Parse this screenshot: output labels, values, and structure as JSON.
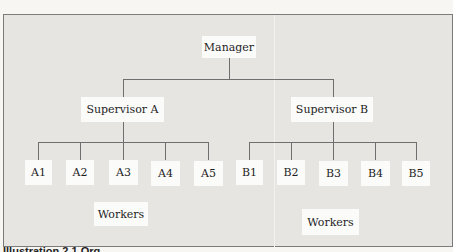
{
  "diagram": {
    "type": "org-chart",
    "root": {
      "label": "Manager"
    },
    "supervisors": [
      {
        "label": "Supervisor A",
        "workers": [
          "A1",
          "A2",
          "A3",
          "A4",
          "A5"
        ],
        "group_label": "Workers"
      },
      {
        "label": "Supervisor B",
        "workers": [
          "B1",
          "B2",
          "B3",
          "B4",
          "B5"
        ],
        "group_label": "Workers"
      }
    ],
    "caption": "Illustration 2.1 Org..."
  },
  "colors": {
    "background": "#e6e5e2",
    "box": "#fbfbfa",
    "line": "#6f6f6f",
    "text": "#1e1e1e"
  }
}
